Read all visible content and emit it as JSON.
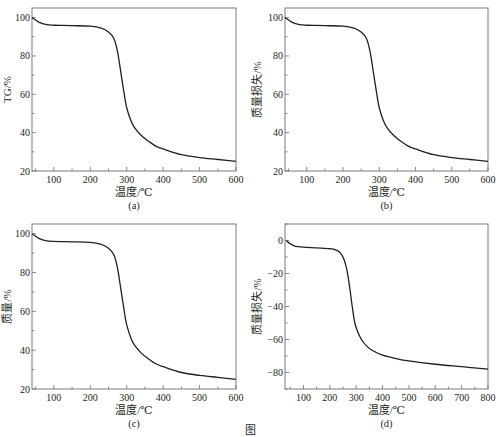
{
  "figure": {
    "caption": "图"
  },
  "chart_data": [
    {
      "id": "a",
      "type": "line",
      "panel_label": "(a)",
      "title": "",
      "xlabel": "温度/℃",
      "ylabel": "TG/%",
      "xlim": [
        40,
        600
      ],
      "ylim": [
        20,
        105
      ],
      "xticks": [
        100,
        200,
        300,
        400,
        500,
        600
      ],
      "yticks": [
        20,
        40,
        60,
        80,
        100
      ],
      "grid": false,
      "legend": null,
      "series": [
        {
          "name": "TG",
          "x": [
            40,
            60,
            80,
            100,
            150,
            200,
            230,
            250,
            265,
            275,
            285,
            295,
            300,
            310,
            320,
            340,
            360,
            380,
            400,
            450,
            500,
            550,
            600
          ],
          "y": [
            100,
            97.5,
            96.3,
            96,
            95.8,
            95.5,
            94.5,
            92.5,
            89,
            82,
            70,
            58,
            53,
            47,
            43,
            38.5,
            35.5,
            33,
            31.5,
            28.5,
            27,
            26,
            25
          ]
        }
      ]
    },
    {
      "id": "b",
      "type": "line",
      "panel_label": "(b)",
      "title": "",
      "xlabel": "温度/℃",
      "ylabel": "质量损失/%",
      "xlim": [
        40,
        600
      ],
      "ylim": [
        20,
        105
      ],
      "xticks": [
        100,
        200,
        300,
        400,
        500,
        600
      ],
      "yticks": [
        20,
        40,
        60,
        80,
        100
      ],
      "grid": false,
      "legend": null,
      "series": [
        {
          "name": "质量损失",
          "x": [
            40,
            60,
            80,
            100,
            150,
            200,
            230,
            250,
            265,
            275,
            285,
            295,
            300,
            310,
            320,
            340,
            360,
            380,
            400,
            450,
            500,
            550,
            600
          ],
          "y": [
            100,
            97.5,
            96.3,
            96,
            95.8,
            95.5,
            94.5,
            92.5,
            89,
            82,
            70,
            58,
            53,
            47,
            43,
            38.5,
            35.5,
            33,
            31.5,
            28.5,
            27,
            26,
            25
          ]
        }
      ]
    },
    {
      "id": "c",
      "type": "line",
      "panel_label": "(c)",
      "title": "",
      "xlabel": "温度/℃",
      "ylabel": "质量/%",
      "xlim": [
        40,
        600
      ],
      "ylim": [
        20,
        105
      ],
      "xticks": [
        100,
        200,
        300,
        400,
        500,
        600
      ],
      "yticks": [
        20,
        40,
        60,
        80,
        100
      ],
      "grid": false,
      "legend": null,
      "series": [
        {
          "name": "质量",
          "x": [
            40,
            60,
            80,
            100,
            150,
            200,
            230,
            250,
            265,
            275,
            285,
            295,
            300,
            310,
            320,
            340,
            360,
            380,
            400,
            450,
            500,
            550,
            600
          ],
          "y": [
            100,
            97.5,
            96.3,
            96,
            95.8,
            95.5,
            94.5,
            92.5,
            89,
            82,
            70,
            58,
            53,
            47,
            43,
            38.5,
            35.5,
            33,
            31.5,
            28.5,
            27,
            26,
            25
          ]
        }
      ]
    },
    {
      "id": "d",
      "type": "line",
      "panel_label": "(d)",
      "title": "",
      "xlabel": "温度/℃",
      "ylabel": "质量损失/%",
      "xlim": [
        30,
        800
      ],
      "ylim": [
        -90,
        10
      ],
      "xticks": [
        100,
        200,
        300,
        400,
        500,
        600,
        700,
        800
      ],
      "yticks": [
        -80,
        -60,
        -40,
        -20,
        0
      ],
      "grid": false,
      "legend": null,
      "series": [
        {
          "name": "质量损失",
          "x": [
            35,
            50,
            70,
            100,
            150,
            200,
            220,
            240,
            255,
            265,
            275,
            285,
            295,
            305,
            320,
            340,
            360,
            400,
            450,
            500,
            600,
            700,
            800
          ],
          "y": [
            0,
            -2,
            -3.5,
            -4,
            -4.5,
            -5,
            -5.5,
            -7.5,
            -12,
            -18,
            -28,
            -40,
            -50,
            -55,
            -60,
            -64,
            -66.5,
            -69.5,
            -71.5,
            -73,
            -75,
            -76.5,
            -78
          ]
        }
      ]
    }
  ]
}
